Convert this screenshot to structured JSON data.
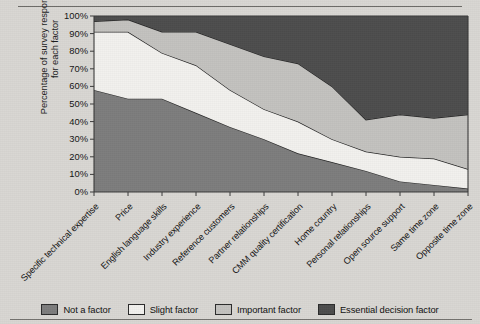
{
  "page": {
    "background_color": "#d9d7d3",
    "rule_color": "#6b6a66"
  },
  "axis": {
    "y_title_line1": "Percentage of survey responses",
    "y_title_line2": "for each factor",
    "y_ticks": [
      "100%",
      "90%",
      "80%",
      "70%",
      "60%",
      "50%",
      "40%",
      "30%",
      "20%",
      "10%",
      "0%"
    ]
  },
  "legend": {
    "items": [
      {
        "label": "Not a factor",
        "color": "#7d7d7d"
      },
      {
        "label": "Slight factor",
        "color": "#f2f1ee"
      },
      {
        "label": "Important factor",
        "color": "#c3c2bf"
      },
      {
        "label": "Essential decision factor",
        "color": "#4d4d4d"
      }
    ]
  },
  "chart_data": {
    "type": "area",
    "stacked": true,
    "title": "",
    "xlabel": "",
    "ylabel": "Percentage of survey responses for each factor",
    "ylim": [
      0,
      100
    ],
    "grid": false,
    "legend_position": "bottom",
    "categories": [
      "Specific technical expertise",
      "Price",
      "English language skills",
      "Industry experience",
      "Reference customers",
      "Partner relationships",
      "CMM quality certification",
      "Home country",
      "Personal relationships",
      "Open source support",
      "Same time zone",
      "Opposite time zone"
    ],
    "series": [
      {
        "name": "Not a factor",
        "color": "#7d7d7d",
        "values": [
          58,
          53,
          53,
          45,
          37,
          30,
          22,
          17,
          12,
          6,
          4,
          2
        ]
      },
      {
        "name": "Slight factor",
        "color": "#f2f1ee",
        "values": [
          33,
          38,
          26,
          27,
          21,
          17,
          18,
          13,
          11,
          14,
          15,
          11
        ]
      },
      {
        "name": "Important factor",
        "color": "#c3c2bf",
        "values": [
          6,
          7,
          12,
          19,
          26,
          30,
          33,
          30,
          18,
          24,
          23,
          31
        ]
      },
      {
        "name": "Essential decision factor",
        "color": "#4d4d4d",
        "values": [
          3,
          2,
          9,
          9,
          16,
          23,
          27,
          40,
          59,
          56,
          58,
          56
        ]
      }
    ],
    "cumulative_tops": {
      "not_a_factor": [
        58,
        53,
        53,
        45,
        37,
        30,
        22,
        17,
        12,
        6,
        4,
        2
      ],
      "slight_factor": [
        91,
        91,
        79,
        72,
        58,
        47,
        40,
        30,
        23,
        20,
        19,
        13
      ],
      "important_factor": [
        97,
        98,
        91,
        91,
        84,
        77,
        73,
        60,
        41,
        44,
        42,
        44
      ],
      "essential_factor": [
        100,
        100,
        100,
        100,
        100,
        100,
        100,
        100,
        100,
        100,
        100,
        100
      ]
    }
  }
}
